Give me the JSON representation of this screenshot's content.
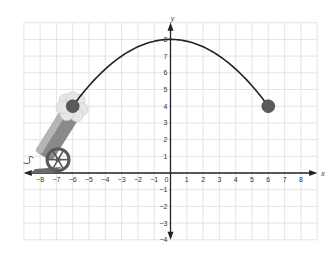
{
  "chart_data": {
    "type": "line",
    "title": "",
    "xlabel": "x",
    "ylabel": "y",
    "xlim": [
      -9,
      9
    ],
    "ylim": [
      -4,
      9
    ],
    "grid": true,
    "x_ticks": [
      -8,
      -7,
      -6,
      -5,
      -4,
      -3,
      -2,
      -1,
      0,
      1,
      2,
      3,
      4,
      5,
      6,
      7,
      8
    ],
    "y_ticks": [
      -4,
      -3,
      -2,
      -1,
      1,
      2,
      3,
      4,
      5,
      6,
      7,
      8
    ],
    "x_tick_labels": [
      "−8",
      "−7",
      "−6",
      "−5",
      "−4",
      "−3",
      "−2",
      "−1",
      "0",
      "1",
      "2",
      "3",
      "4",
      "5",
      "6",
      "7",
      "8"
    ],
    "y_tick_labels": [
      "−4",
      "−3",
      "−2",
      "−1",
      "1",
      "2",
      "3",
      "4",
      "5",
      "6",
      "7",
      "8"
    ],
    "series": [
      {
        "name": "cannonball trajectory",
        "equation": "y = 8 - x^2/9",
        "x": [
          -6,
          -5,
          -4,
          -3,
          -2,
          -1,
          0,
          1,
          2,
          3,
          4,
          5,
          6
        ],
        "y": [
          4,
          5.22,
          6.22,
          7,
          7.56,
          7.89,
          8,
          7.89,
          7.56,
          7,
          6.22,
          5.22,
          4
        ],
        "color": "#222222"
      }
    ],
    "points": [
      {
        "name": "launch point",
        "x": -6,
        "y": 4,
        "color": "#555555"
      },
      {
        "name": "landing point",
        "x": 6,
        "y": 4,
        "color": "#555555"
      }
    ],
    "annotations": [
      "cannon illustration at lower left firing toward (-6, 4)",
      "smoke puff around launch point"
    ],
    "vertex": {
      "x": 0,
      "y": 8
    }
  },
  "colors": {
    "grid": "#d9d9d9",
    "axis": "#222222",
    "curve": "#222222",
    "ball": "#5a5a5a",
    "smoke": "#e6e6e6",
    "cannon_barrel": "#8a8a8a",
    "cannon_band": "#4a4a4a",
    "wheel": "#5a5a5a"
  }
}
